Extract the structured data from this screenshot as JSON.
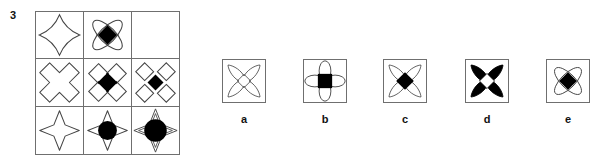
{
  "question": {
    "number": "3",
    "type": "matrix-reasoning"
  },
  "matrix": {
    "rows": 3,
    "cols": 3,
    "cells": [
      {
        "id": "r1c1",
        "row": 1,
        "col": 1,
        "shape": "curved-four-point-star-outline",
        "fill": "none",
        "center": "none",
        "empty": false
      },
      {
        "id": "r1c2",
        "row": 1,
        "col": 2,
        "shape": "two-crossed-ellipses-outline",
        "fill": "none",
        "center": "black-diamond",
        "empty": false
      },
      {
        "id": "r1c3",
        "row": 1,
        "col": 3,
        "shape": "blank",
        "fill": "none",
        "center": "none",
        "empty": true
      },
      {
        "id": "r2c1",
        "row": 2,
        "col": 1,
        "shape": "straight-cross-outline",
        "fill": "none",
        "center": "none",
        "empty": false
      },
      {
        "id": "r2c2",
        "row": 2,
        "col": 2,
        "shape": "four-overlapping-diamonds-outline",
        "fill": "none",
        "center": "black-diamond",
        "empty": false
      },
      {
        "id": "r2c3",
        "row": 2,
        "col": 3,
        "shape": "four-separated-diamonds-outline",
        "fill": "none",
        "center": "black-diamond-small",
        "empty": false
      },
      {
        "id": "r3c1",
        "row": 3,
        "col": 1,
        "shape": "straight-four-point-star-outline",
        "fill": "none",
        "center": "none",
        "empty": false
      },
      {
        "id": "r3c2",
        "row": 3,
        "col": 2,
        "shape": "straight-four-point-star-outline",
        "fill": "none",
        "center": "black-circle",
        "empty": false
      },
      {
        "id": "r3c3",
        "row": 3,
        "col": 3,
        "shape": "double-outline-four-point-star",
        "fill": "none",
        "center": "black-circle-large",
        "empty": false
      }
    ]
  },
  "options": [
    {
      "key": "a",
      "label": "a",
      "shape": "four-petals-outline",
      "petal_fill": "none",
      "center": "diamond-outline"
    },
    {
      "key": "b",
      "label": "b",
      "shape": "four-ellipses-plus-outline",
      "petal_fill": "none",
      "center": "black-square"
    },
    {
      "key": "c",
      "label": "c",
      "shape": "four-petals-outline",
      "petal_fill": "none",
      "center": "black-diamond"
    },
    {
      "key": "d",
      "label": "d",
      "shape": "four-petals-filled",
      "petal_fill": "black",
      "center": "diamond-outline"
    },
    {
      "key": "e",
      "label": "e",
      "shape": "two-crossed-ellipses-outline",
      "petal_fill": "none",
      "center": "black-diamond"
    }
  ],
  "colors": {
    "stroke": "#444444",
    "border": "#6f6f6f",
    "fill_black": "#000000",
    "background": "#ffffff",
    "text": "#111111"
  }
}
